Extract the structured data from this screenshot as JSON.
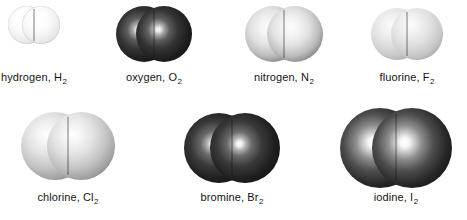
{
  "figure": {
    "background_color": "#ffffff",
    "text_color": "#141414",
    "width": 467,
    "height": 220,
    "rows": 2,
    "columns": 4
  },
  "molecules": [
    {
      "id": "hydrogen",
      "name": "hydrogen",
      "label": "hydrogen, H",
      "subscript": "2",
      "formula": "H2",
      "symbol": "H",
      "shade": "hydrogen",
      "shade_color": "#f4f4f4",
      "row": 1,
      "column": 1,
      "cell_left": 8,
      "cell_top": 6,
      "molecule_width": 52,
      "atom_diameter": 38,
      "caption_top": 71
    },
    {
      "id": "oxygen",
      "name": "oxygen",
      "label": "oxygen, O",
      "subscript": "2",
      "formula": "O2",
      "symbol": "O",
      "shade": "oxygen",
      "shade_color": "#262626",
      "row": 1,
      "column": 2,
      "cell_left": 116,
      "cell_top": 6,
      "molecule_width": 76,
      "atom_diameter": 56,
      "caption_top": 71
    },
    {
      "id": "nitrogen",
      "name": "nitrogen",
      "label": "nitrogen, N",
      "subscript": "2",
      "formula": "N2",
      "symbol": "N",
      "shade": "nitrogen",
      "shade_color": "#d9d9d9",
      "row": 1,
      "column": 3,
      "cell_left": 245,
      "cell_top": 6,
      "molecule_width": 78,
      "atom_diameter": 56,
      "caption_top": 71
    },
    {
      "id": "fluorine",
      "name": "fluorine",
      "label": "fluorine, F",
      "subscript": "2",
      "formula": "F2",
      "symbol": "F",
      "shade": "fluorine",
      "shade_color": "#dcdcdc",
      "row": 1,
      "column": 4,
      "cell_left": 371,
      "cell_top": 8,
      "molecule_width": 72,
      "atom_diameter": 52,
      "caption_top": 71
    },
    {
      "id": "chlorine",
      "name": "chlorine",
      "label": "chlorine, Cl",
      "subscript": "2",
      "formula": "Cl2",
      "symbol": "Cl",
      "shade": "chlorine",
      "shade_color": "#cfcfcf",
      "row": 2,
      "column": 1,
      "cell_left": 21,
      "cell_top": 112,
      "molecule_width": 94,
      "atom_diameter": 68,
      "caption_top": 191
    },
    {
      "id": "bromine",
      "name": "bromine",
      "label": "bromine, Br",
      "subscript": "2",
      "formula": "Br2",
      "symbol": "Br",
      "shade": "bromine",
      "shade_color": "#1c1c1c",
      "row": 2,
      "column": 2,
      "cell_left": 184,
      "cell_top": 113,
      "molecule_width": 96,
      "atom_diameter": 70,
      "caption_top": 191
    },
    {
      "id": "iodine",
      "name": "iodine",
      "label": "iodine, I",
      "subscript": "2",
      "formula": "I2",
      "symbol": "I",
      "shade": "iodine",
      "shade_color": "#232323",
      "row": 2,
      "column": 3,
      "cell_left": 340,
      "cell_top": 108,
      "molecule_width": 112,
      "atom_diameter": 80,
      "caption_top": 191
    }
  ]
}
